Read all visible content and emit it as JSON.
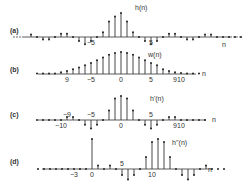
{
  "chart_data": [
    {
      "type": "stem",
      "panel_label": "(a)",
      "series_label": "h(n)",
      "axis_label": "n",
      "tick_labels": [
        {
          "n": -5,
          "text": "−5"
        },
        {
          "n": 5,
          "text": "5"
        }
      ],
      "continues_both_sides": true,
      "x": [
        -15,
        -14,
        -13,
        -12,
        -11,
        -10,
        -9,
        -8,
        -7,
        -6,
        -5,
        -4,
        -3,
        -2,
        -1,
        0,
        1,
        2,
        3,
        4,
        5,
        6,
        7,
        8,
        9,
        10,
        11,
        12,
        13,
        14,
        15,
        16,
        17,
        18,
        19,
        20
      ],
      "values": [
        0.1,
        0,
        -0.1,
        -0.1,
        0,
        0.14,
        0.14,
        0,
        -0.17,
        -0.3,
        -0.17,
        0,
        0.2,
        0.65,
        0.85,
        1.0,
        0.65,
        0.2,
        0,
        -0.17,
        -0.3,
        -0.17,
        0,
        0.14,
        0.14,
        0,
        -0.1,
        -0.1,
        0,
        0.1,
        0.1,
        0,
        0,
        0,
        0,
        0
      ]
    },
    {
      "type": "stem",
      "panel_label": "(b)",
      "series_label": "w(n)",
      "axis_label": "n",
      "tick_labels": [
        {
          "n": -9,
          "text": "9"
        },
        {
          "n": -5,
          "text": "−5"
        },
        {
          "n": 0,
          "text": "0"
        },
        {
          "n": 5,
          "text": "5"
        },
        {
          "n": 9,
          "text": "9"
        },
        {
          "n": 10,
          "text": "10"
        }
      ],
      "x": [
        -14,
        -13,
        -12,
        -11,
        -10,
        -9,
        -8,
        -7,
        -6,
        -5,
        -4,
        -3,
        -2,
        -1,
        0,
        1,
        2,
        3,
        4,
        5,
        6,
        7,
        8,
        9,
        10,
        11,
        12,
        13
      ],
      "values": [
        0.02,
        0.02,
        0.02,
        0.02,
        0.08,
        0.14,
        0.22,
        0.3,
        0.4,
        0.5,
        0.62,
        0.75,
        0.88,
        0.96,
        1.0,
        0.96,
        0.88,
        0.75,
        0.62,
        0.5,
        0.4,
        0.22,
        0.14,
        0.08,
        0.04,
        0.02,
        0.02,
        0.02
      ]
    },
    {
      "type": "stem",
      "panel_label": "(c)",
      "series_label": "h'(n)",
      "axis_label": "n",
      "tick_labels": [
        {
          "n": -10,
          "text": "−10"
        },
        {
          "n": -9,
          "text": "−9",
          "above": true
        },
        {
          "n": -5,
          "text": "−5",
          "above": true
        },
        {
          "n": 0,
          "text": "0"
        },
        {
          "n": 5,
          "text": "5",
          "above": true
        },
        {
          "n": 9,
          "text": "9"
        },
        {
          "n": 10,
          "text": "10"
        }
      ],
      "x": [
        -14,
        -13,
        -12,
        -11,
        -10,
        -9,
        -8,
        -7,
        -6,
        -5,
        -4,
        -3,
        -2,
        -1,
        0,
        1,
        2,
        3,
        4,
        5,
        6,
        7,
        8,
        9,
        10,
        11,
        12,
        13,
        14
      ],
      "values": [
        0,
        0,
        0,
        0,
        0,
        0.12,
        0.12,
        0,
        -0.2,
        -0.35,
        -0.2,
        0,
        0.4,
        0.9,
        1.0,
        0.9,
        0.4,
        0,
        -0.2,
        -0.35,
        -0.2,
        0,
        0.12,
        0.12,
        0,
        0,
        0,
        0,
        0
      ]
    },
    {
      "type": "stem",
      "panel_label": "(d)",
      "series_label": "h''(n)",
      "axis_label": "n",
      "tick_labels": [
        {
          "n": -3,
          "text": "−3"
        },
        {
          "n": 0,
          "text": "0"
        },
        {
          "n": 5,
          "text": "5",
          "above": true
        },
        {
          "n": 10,
          "text": "10"
        }
      ],
      "x": [
        -9,
        -8,
        -7,
        -6,
        -5,
        -4,
        -3,
        -2,
        -1,
        0,
        1,
        2,
        3,
        4,
        5,
        6,
        7,
        8,
        9,
        10,
        11,
        12,
        13,
        14,
        15,
        16,
        17,
        18,
        19,
        20,
        21,
        22
      ],
      "values": [
        0,
        0,
        0,
        0,
        0,
        0,
        0,
        0,
        0,
        1.0,
        0.12,
        0,
        0.12,
        0,
        -0.2,
        -0.35,
        -0.2,
        0,
        0.4,
        0.9,
        1.0,
        0.9,
        0.4,
        0,
        -0.2,
        -0.35,
        -0.2,
        0,
        0.12,
        0,
        0,
        0
      ]
    }
  ]
}
